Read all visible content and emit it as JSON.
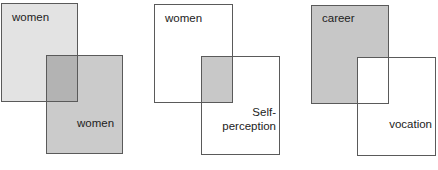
{
  "diagram": {
    "type": "overlapping-rectangles",
    "panels": [
      {
        "id": "panel-1",
        "rect_a": {
          "label": "women",
          "fill": "#e3e3e3",
          "x": 1,
          "y": 3,
          "w": 77,
          "h": 99
        },
        "rect_b": {
          "label": "women",
          "fill": "#cbcbcb",
          "x": 46,
          "y": 55,
          "w": 77,
          "h": 99
        },
        "overlap": {
          "fill": "#b3b3b3",
          "x": 46,
          "y": 55,
          "w": 32,
          "h": 47
        }
      },
      {
        "id": "panel-2",
        "rect_a": {
          "label": "women",
          "fill": "#ffffff",
          "x": 154,
          "y": 4,
          "w": 79,
          "h": 99
        },
        "rect_b": {
          "label_line1": "Self-",
          "label_line2": "perception",
          "fill": "#ffffff",
          "x": 201,
          "y": 56,
          "w": 79,
          "h": 99
        },
        "overlap": {
          "fill": "#c8c8c8",
          "x": 201,
          "y": 56,
          "w": 32,
          "h": 47
        }
      },
      {
        "id": "panel-3",
        "rect_a": {
          "label": "career",
          "fill": "#c7c7c7",
          "x": 311,
          "y": 5,
          "w": 78,
          "h": 99
        },
        "rect_b": {
          "label": "vocation",
          "fill": "#ffffff",
          "x": 357,
          "y": 57,
          "w": 79,
          "h": 99
        },
        "overlap": {
          "fill": "#ffffff",
          "x": 357,
          "y": 57,
          "w": 32,
          "h": 47
        }
      }
    ],
    "colors": {
      "border": "#5a5a5a",
      "text": "#222222",
      "background": "#ffffff"
    }
  }
}
